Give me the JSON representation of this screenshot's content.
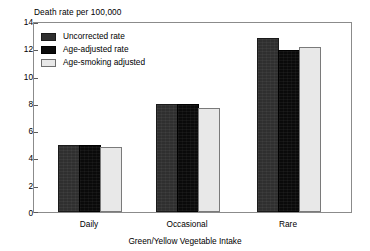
{
  "chart_data": {
    "type": "bar",
    "title": "",
    "ylabel": "Death rate per 100,000",
    "xlabel": "Green/Yellow Vegetable Intake",
    "categories": [
      "Daily",
      "Occasional",
      "Rare"
    ],
    "series": [
      {
        "name": "Uncorrected rate",
        "values": [
          4.9,
          7.95,
          12.75
        ],
        "color": "#2f2f2f"
      },
      {
        "name": "Age-adjusted rate",
        "values": [
          4.9,
          7.95,
          11.9
        ],
        "color": "#0a0a0a"
      },
      {
        "name": "Age-smoking adjusted",
        "values": [
          4.8,
          7.65,
          12.1
        ],
        "color": "#e8e8e8"
      }
    ],
    "ylim": [
      0,
      14
    ],
    "yticks": [
      0,
      2,
      4,
      6,
      8,
      10,
      12,
      14
    ],
    "ytick_labels": [
      "0",
      "2",
      "4",
      "6",
      "8",
      "10",
      "12",
      "14"
    ],
    "grid": false,
    "legend_position": "top-left"
  },
  "axes": {
    "y_title": "Death rate per 100,000",
    "x_title": "Green/Yellow Vegetable Intake"
  }
}
